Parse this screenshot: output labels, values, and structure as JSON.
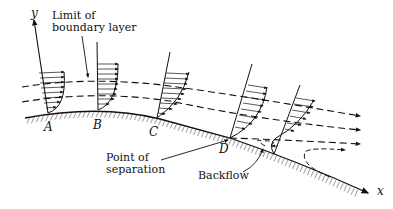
{
  "diagram": {
    "axes": {
      "x_label": "x",
      "y_label": "y"
    },
    "annotations": {
      "limit_line1": "Limit of",
      "limit_line2": "boundary layer",
      "separation_line1": "Point of",
      "separation_line2": "separation",
      "backflow": "Backflow"
    },
    "points": [
      {
        "id": "A",
        "label": "A"
      },
      {
        "id": "B",
        "label": "B"
      },
      {
        "id": "C",
        "label": "C"
      },
      {
        "id": "D",
        "label": "D"
      }
    ],
    "colors": {
      "ink": "#111111",
      "background": "#ffffff"
    }
  }
}
